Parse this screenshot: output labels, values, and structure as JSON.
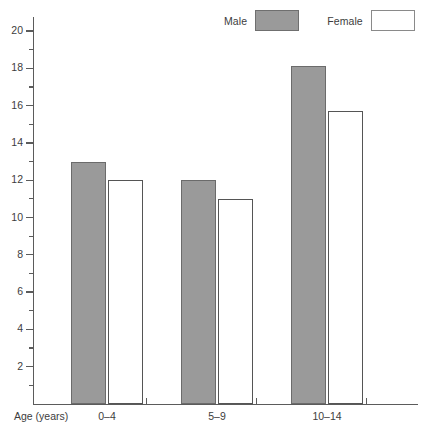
{
  "chart_data": {
    "type": "bar",
    "title": "",
    "xlabel": "Age (years)",
    "ylabel": "",
    "categories": [
      "0–4",
      "5–9",
      "10–14"
    ],
    "series": [
      {
        "name": "Male",
        "color": "#9a9a9a",
        "values": [
          13,
          12,
          18.1
        ]
      },
      {
        "name": "Female",
        "color": "#ffffff",
        "values": [
          12,
          11,
          15.7
        ]
      }
    ],
    "ylim": [
      0,
      20
    ],
    "ytick_step": 2,
    "yminor_step": 1,
    "ytick_labels": [
      "2",
      "4",
      "6",
      "8",
      "10",
      "12",
      "14",
      "16",
      "18",
      "20"
    ],
    "ytick_values": [
      2,
      4,
      6,
      8,
      10,
      12,
      14,
      16,
      18,
      20
    ],
    "yminor_values": [
      1,
      3,
      5,
      7,
      9,
      11,
      13,
      15,
      17,
      19
    ],
    "grid": false,
    "legend_position": "top-right"
  },
  "legend": {
    "male_label": "Male",
    "female_label": "Female"
  },
  "axis": {
    "x_caption": "Age (years)"
  }
}
